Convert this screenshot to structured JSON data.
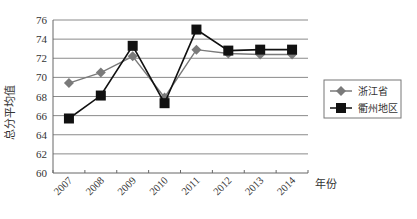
{
  "chart_data": {
    "type": "line",
    "title": "",
    "xlabel": "年份",
    "ylabel": "总分平均值",
    "categories": [
      "2007",
      "2008",
      "2009",
      "2010",
      "2011",
      "2012",
      "2013",
      "2014"
    ],
    "series": [
      {
        "name": "浙江省",
        "marker": "diamond",
        "color": "#7a7a7a",
        "values": [
          69.4,
          70.5,
          72.2,
          67.9,
          72.9,
          72.5,
          72.4,
          72.4
        ]
      },
      {
        "name": "衢州地区",
        "marker": "square",
        "color": "#111111",
        "values": [
          65.7,
          68.1,
          73.3,
          67.3,
          75.0,
          72.8,
          72.9,
          72.9
        ]
      }
    ],
    "ylim": [
      60,
      76
    ],
    "yticks": [
      60,
      62,
      64,
      66,
      68,
      70,
      72,
      74,
      76
    ],
    "grid": true,
    "legend_position": "right"
  }
}
